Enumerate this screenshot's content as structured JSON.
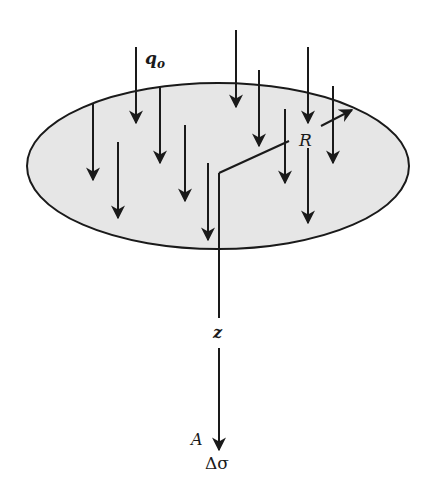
{
  "diagram": {
    "labels": {
      "load": "q",
      "load_sub": "o",
      "radius": "R",
      "depth": "z",
      "point": "A",
      "stress": "Δσ"
    },
    "colors": {
      "area_fill": "#e6e6e6",
      "stroke": "#1a1a1a",
      "background": "#ffffff"
    },
    "circle": {
      "cx": 218,
      "cy": 166,
      "rx": 191,
      "ry": 83
    },
    "load_arrows": [
      {
        "x": 136,
        "y1": 47,
        "y2": 123
      },
      {
        "x": 236,
        "y1": 30,
        "y2": 107
      },
      {
        "x": 93,
        "y1": 103,
        "y2": 180
      },
      {
        "x": 160,
        "y1": 86,
        "y2": 163
      },
      {
        "x": 118,
        "y1": 142,
        "y2": 218
      },
      {
        "x": 185,
        "y1": 125,
        "y2": 201
      },
      {
        "x": 259,
        "y1": 70,
        "y2": 146
      },
      {
        "x": 308,
        "y1": 47,
        "y2": 123
      },
      {
        "x": 333,
        "y1": 86,
        "y2": 163
      },
      {
        "x": 285,
        "y1": 109,
        "y2": 183
      },
      {
        "x": 308,
        "y1": 148,
        "y2": 223
      },
      {
        "x": 208,
        "y1": 163,
        "y2": 240
      }
    ]
  }
}
